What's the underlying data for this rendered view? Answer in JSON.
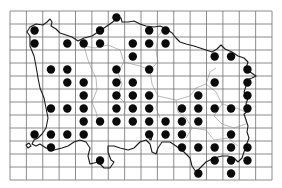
{
  "map": {
    "title": "",
    "type": "distribution-dot-map",
    "grid": {
      "columns": 16,
      "rows": 13
    },
    "colors": {
      "dot": "#0a0a0a",
      "grid": "#6e6e6e",
      "coast": "#1a1a1a",
      "boundary": "#8a8a8a",
      "background": "#ffffff"
    },
    "records": [
      {
        "row": 0,
        "cols": [
          6
        ]
      },
      {
        "row": 1,
        "cols": [
          1,
          5,
          8,
          9
        ]
      },
      {
        "row": 2,
        "cols": [
          1,
          3,
          4,
          5,
          7,
          8,
          9
        ]
      },
      {
        "row": 3,
        "cols": [
          7,
          12,
          13
        ]
      },
      {
        "row": 4,
        "cols": [
          2,
          3,
          6,
          8,
          14
        ]
      },
      {
        "row": 5,
        "cols": [
          3,
          4,
          6,
          7,
          12,
          14
        ]
      },
      {
        "row": 6,
        "cols": [
          4,
          6,
          7,
          8,
          11,
          14
        ]
      },
      {
        "row": 7,
        "cols": [
          2,
          3,
          4,
          6,
          7,
          8,
          10,
          11,
          12,
          13,
          14
        ]
      },
      {
        "row": 8,
        "cols": [
          4,
          5,
          6,
          7,
          8,
          9,
          10,
          11
        ]
      },
      {
        "row": 9,
        "cols": [
          1,
          2,
          3,
          4,
          8,
          9,
          10,
          13
        ]
      },
      {
        "row": 10,
        "cols": [
          2,
          10,
          11,
          12,
          13,
          14
        ]
      },
      {
        "row": 11,
        "cols": [
          5,
          12,
          13,
          14
        ]
      },
      {
        "row": 12,
        "cols": [
          11,
          13
        ]
      }
    ]
  }
}
